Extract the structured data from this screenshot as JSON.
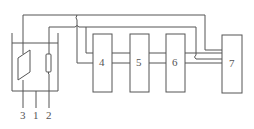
{
  "diagram": {
    "type": "block-diagram",
    "colors": {
      "stroke": "#555555",
      "background": "#ffffff",
      "text": "#555555"
    },
    "parts": {
      "beaker": {
        "label": "1"
      },
      "electrode_cylinder": {
        "label": "2"
      },
      "electrode_plate": {
        "label": "3"
      }
    },
    "blocks": [
      {
        "id": "b4",
        "label": "4"
      },
      {
        "id": "b5",
        "label": "5"
      },
      {
        "id": "b6",
        "label": "6"
      },
      {
        "id": "b7",
        "label": "7"
      }
    ],
    "bottom_labels": [
      "3",
      "1",
      "2"
    ]
  }
}
